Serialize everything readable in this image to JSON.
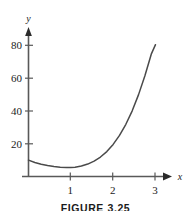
{
  "figure": {
    "caption": "FIGURE 3.25",
    "background_color": "#ffffff",
    "curve_color": "#4a4a4a",
    "axis_color": "#595959",
    "text_color": "#1b1b1b"
  },
  "chart_data": {
    "type": "line",
    "title": "",
    "subtitle": "",
    "xlabel": "x",
    "ylabel": "y",
    "xlim": [
      0,
      3.35
    ],
    "ylim": [
      0,
      90
    ],
    "grid": false,
    "legend": null,
    "xticks": [
      1,
      2,
      3
    ],
    "xtick_labels": [
      "1",
      "2",
      "3"
    ],
    "yticks": [
      20,
      40,
      60,
      80
    ],
    "ytick_labels": [
      "20",
      "40",
      "60",
      "80"
    ],
    "axis_arrows": [
      "x-positive",
      "y-positive"
    ],
    "annotations": [],
    "series": [
      {
        "name": "curve",
        "x": [
          0.0,
          0.15,
          0.3,
          0.45,
          0.6,
          0.75,
          0.9,
          1.0,
          1.1,
          1.25,
          1.4,
          1.55,
          1.7,
          1.85,
          2.0,
          2.15,
          2.3,
          2.45,
          2.6,
          2.75,
          2.9,
          3.0
        ],
        "y": [
          10.0,
          8.6,
          7.5,
          6.7,
          6.1,
          5.7,
          5.5,
          5.5,
          5.7,
          6.4,
          7.6,
          9.4,
          11.9,
          15.2,
          19.6,
          25.1,
          31.9,
          40.1,
          50.0,
          61.5,
          74.7,
          80.5
        ]
      }
    ]
  }
}
